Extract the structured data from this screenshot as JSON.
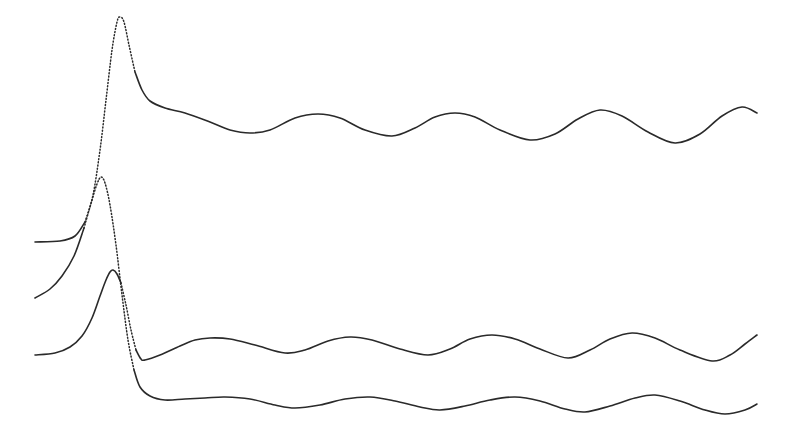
{
  "chart_data": {
    "type": "line",
    "title": "",
    "xlabel": "",
    "ylabel": "",
    "grid": false,
    "legend": null,
    "axes_visible": false,
    "note": "Three stacked waveform traces, each with an initial sharp peak followed by damped sinusoidal oscillation. Coordinates are in image pixel space (y increases downward).",
    "stroke_color": "#2a2a2a",
    "series": [
      {
        "name": "trace-top",
        "baseline_start_y": 242,
        "peak": {
          "x": 120,
          "y": 17
        },
        "points": [
          [
            35,
            242
          ],
          [
            60,
            241
          ],
          [
            75,
            236
          ],
          [
            85,
            222
          ],
          [
            93,
            195
          ],
          [
            100,
            150
          ],
          [
            106,
            100
          ],
          [
            112,
            50
          ],
          [
            117,
            22
          ],
          [
            120,
            17
          ],
          [
            124,
            22
          ],
          [
            129,
            45
          ],
          [
            135,
            72
          ],
          [
            142,
            90
          ],
          [
            150,
            101
          ],
          [
            165,
            108
          ],
          [
            185,
            113
          ],
          [
            210,
            122
          ],
          [
            230,
            130
          ],
          [
            250,
            133
          ],
          [
            270,
            130
          ],
          [
            295,
            118
          ],
          [
            318,
            114
          ],
          [
            340,
            118
          ],
          [
            365,
            130
          ],
          [
            392,
            136
          ],
          [
            415,
            128
          ],
          [
            435,
            117
          ],
          [
            455,
            113
          ],
          [
            475,
            117
          ],
          [
            500,
            130
          ],
          [
            530,
            140
          ],
          [
            555,
            134
          ],
          [
            578,
            119
          ],
          [
            600,
            110
          ],
          [
            622,
            116
          ],
          [
            648,
            132
          ],
          [
            675,
            143
          ],
          [
            700,
            134
          ],
          [
            722,
            116
          ],
          [
            742,
            107
          ],
          [
            757,
            113
          ]
        ]
      },
      {
        "name": "trace-middle",
        "baseline_start_y": 298,
        "peak": {
          "x": 101,
          "y": 177
        },
        "points": [
          [
            35,
            298
          ],
          [
            50,
            289
          ],
          [
            62,
            276
          ],
          [
            74,
            256
          ],
          [
            84,
            228
          ],
          [
            92,
            200
          ],
          [
            97,
            184
          ],
          [
            101,
            177
          ],
          [
            105,
            183
          ],
          [
            110,
            205
          ],
          [
            116,
            245
          ],
          [
            122,
            295
          ],
          [
            128,
            340
          ],
          [
            134,
            370
          ],
          [
            140,
            387
          ],
          [
            150,
            396
          ],
          [
            165,
            400
          ],
          [
            185,
            399
          ],
          [
            205,
            398
          ],
          [
            225,
            397
          ],
          [
            250,
            399
          ],
          [
            275,
            405
          ],
          [
            295,
            408
          ],
          [
            320,
            405
          ],
          [
            345,
            399
          ],
          [
            370,
            397
          ],
          [
            395,
            401
          ],
          [
            420,
            407
          ],
          [
            440,
            410
          ],
          [
            465,
            406
          ],
          [
            490,
            400
          ],
          [
            515,
            397
          ],
          [
            540,
            401
          ],
          [
            565,
            409
          ],
          [
            585,
            412
          ],
          [
            610,
            406
          ],
          [
            635,
            398
          ],
          [
            655,
            395
          ],
          [
            680,
            401
          ],
          [
            705,
            410
          ],
          [
            725,
            414
          ],
          [
            745,
            410
          ],
          [
            757,
            404
          ]
        ]
      },
      {
        "name": "trace-lower",
        "baseline_start_y": 355,
        "peak": {
          "x": 113,
          "y": 270
        },
        "points": [
          [
            35,
            355
          ],
          [
            55,
            353
          ],
          [
            70,
            347
          ],
          [
            82,
            336
          ],
          [
            92,
            318
          ],
          [
            100,
            296
          ],
          [
            106,
            280
          ],
          [
            110,
            272
          ],
          [
            113,
            270
          ],
          [
            117,
            274
          ],
          [
            121,
            283
          ],
          [
            126,
            305
          ],
          [
            131,
            330
          ],
          [
            136,
            350
          ],
          [
            141,
            359
          ],
          [
            145,
            360
          ],
          [
            160,
            355
          ],
          [
            180,
            346
          ],
          [
            195,
            340
          ],
          [
            210,
            338
          ],
          [
            230,
            339
          ],
          [
            255,
            345
          ],
          [
            285,
            353
          ],
          [
            305,
            350
          ],
          [
            328,
            341
          ],
          [
            350,
            337
          ],
          [
            372,
            340
          ],
          [
            400,
            349
          ],
          [
            428,
            355
          ],
          [
            450,
            349
          ],
          [
            470,
            339
          ],
          [
            492,
            335
          ],
          [
            515,
            339
          ],
          [
            540,
            349
          ],
          [
            568,
            358
          ],
          [
            590,
            350
          ],
          [
            610,
            339
          ],
          [
            632,
            333
          ],
          [
            655,
            338
          ],
          [
            680,
            350
          ],
          [
            712,
            361
          ],
          [
            730,
            355
          ],
          [
            745,
            344
          ],
          [
            757,
            335
          ]
        ]
      }
    ]
  }
}
